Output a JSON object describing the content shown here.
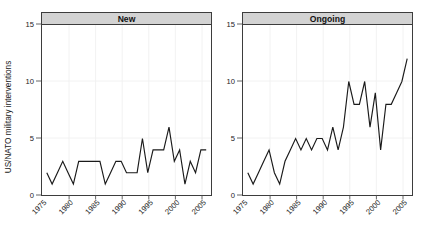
{
  "chart_data": {
    "type": "line",
    "title": "",
    "xlabel": "",
    "ylabel": "US/NATO military interventions",
    "xlim": [
      1974,
      2006
    ],
    "ylim": [
      0,
      15
    ],
    "yticks": [
      0,
      5,
      10,
      15
    ],
    "ytick_labels": [
      "0",
      "5",
      "10",
      "15"
    ],
    "xticks": [
      1975,
      1980,
      1985,
      1990,
      1995,
      2000,
      2005
    ],
    "xtick_labels": [
      "1975",
      "1980",
      "1985",
      "1990",
      "1995",
      "2000",
      "2005"
    ],
    "grid": true,
    "legend": "none",
    "panel_layout": "1x2",
    "panels": [
      {
        "label": "New",
        "x": [
          1975,
          1976,
          1977,
          1978,
          1979,
          1980,
          1981,
          1982,
          1983,
          1984,
          1985,
          1986,
          1987,
          1988,
          1989,
          1990,
          1991,
          1992,
          1993,
          1994,
          1995,
          1996,
          1997,
          1998,
          1999,
          2000,
          2001,
          2002,
          2003,
          2004,
          2005
        ],
        "values": [
          2,
          1,
          2,
          3,
          2,
          1,
          3,
          3,
          3,
          3,
          3,
          1,
          2,
          3,
          3,
          2,
          2,
          2,
          5,
          2,
          4,
          4,
          4,
          6,
          3,
          4,
          1,
          3,
          2,
          4,
          4
        ]
      },
      {
        "label": "Ongoing",
        "x": [
          1975,
          1976,
          1977,
          1978,
          1979,
          1980,
          1981,
          1982,
          1983,
          1984,
          1985,
          1986,
          1987,
          1988,
          1989,
          1990,
          1991,
          1992,
          1993,
          1994,
          1995,
          1996,
          1997,
          1998,
          1999,
          2000,
          2001,
          2002,
          2003,
          2004,
          2005
        ],
        "values": [
          2,
          1,
          2,
          3,
          4,
          2,
          1,
          3,
          4,
          5,
          4,
          5,
          4,
          5,
          5,
          4,
          6,
          4,
          6,
          10,
          8,
          8,
          10,
          6,
          9,
          4,
          8,
          8,
          9,
          10,
          12
        ]
      }
    ]
  },
  "axis": {
    "ylabel": "US/NATO military interventions",
    "ytick_0": "0",
    "ytick_5": "5",
    "ytick_10": "10",
    "ytick_15": "15"
  },
  "panel_left": {
    "strip_label": "New",
    "xtick_1": "1975",
    "xtick_2": "1980",
    "xtick_3": "1985",
    "xtick_4": "1990",
    "xtick_5": "1995",
    "xtick_6": "2000",
    "xtick_7": "2005"
  },
  "panel_right": {
    "strip_label": "Ongoing",
    "xtick_1": "1975",
    "xtick_2": "1980",
    "xtick_3": "1985",
    "xtick_4": "1990",
    "xtick_5": "1995",
    "xtick_6": "2000",
    "xtick_7": "2005"
  },
  "colors": {
    "line": "#1a1a1a",
    "strip_bg": "#d3d3d3",
    "panel_border": "#3d3d3d",
    "grid": "#f0f0f0"
  }
}
